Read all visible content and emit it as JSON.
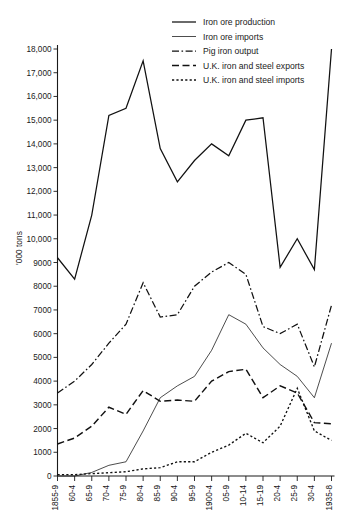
{
  "chart_data": {
    "type": "line",
    "title": "",
    "xlabel": "",
    "ylabel": "'000 tons",
    "ylim": [
      0,
      18000
    ],
    "ytick_step": 1000,
    "grid": false,
    "legend_position": "top-center",
    "categories": [
      "1855-9",
      "60-4",
      "65-9",
      "70-4",
      "75-9",
      "80-4",
      "85-9",
      "90-4",
      "95-9",
      "1900-4",
      "05-9",
      "10-14",
      "15-19",
      "20-4",
      "25-9",
      "30-4",
      "1935-8"
    ],
    "ytick_labels": [
      "0",
      "1000",
      "2000",
      "3000",
      "4000",
      "5000",
      "6000",
      "7000",
      "8000",
      "9000",
      "10,000",
      "11,000",
      "12,000",
      "13,000",
      "14,000",
      "15,000",
      "16,000",
      "17,000",
      "18,000"
    ],
    "series": [
      {
        "name": "Iron ore production",
        "style": "solid-thick",
        "values": [
          9200,
          8300,
          11000,
          15200,
          15500,
          17500,
          13800,
          12400,
          13300,
          14000,
          13500,
          15000,
          15100,
          8800,
          10000,
          8700,
          18000
        ]
      },
      {
        "name": "Iron ore imports",
        "style": "solid-thin",
        "values": [
          0,
          0,
          150,
          450,
          600,
          1900,
          3300,
          3800,
          4200,
          5300,
          6800,
          6400,
          5400,
          4700,
          4200,
          3300,
          5600
        ]
      },
      {
        "name": "Pig iron output",
        "style": "dash-dot",
        "values": [
          3500,
          4000,
          4700,
          5600,
          6400,
          8150,
          6700,
          6800,
          8000,
          8600,
          9000,
          8500,
          6300,
          6000,
          6400,
          4600,
          7200
        ]
      },
      {
        "name": "U.K. iron and steel exports",
        "style": "dashed",
        "values": [
          1350,
          1600,
          2100,
          2900,
          2600,
          3600,
          3150,
          3200,
          3150,
          4000,
          4400,
          4500,
          3300,
          3800,
          3500,
          2250,
          2200
        ]
      },
      {
        "name": "U.K. iron and steel imports",
        "style": "dotted",
        "values": [
          60,
          60,
          100,
          140,
          180,
          300,
          350,
          600,
          600,
          1000,
          1300,
          1800,
          1400,
          2100,
          3700,
          1900,
          1500
        ]
      }
    ]
  },
  "legend": {
    "items": [
      {
        "label": "Iron ore production"
      },
      {
        "label": "Iron ore imports"
      },
      {
        "label": "Pig iron output"
      },
      {
        "label": "U.K. iron and steel exports"
      },
      {
        "label": "U.K. iron and steel imports"
      }
    ]
  },
  "axes": {
    "y_axis_title": "'000 tons"
  }
}
